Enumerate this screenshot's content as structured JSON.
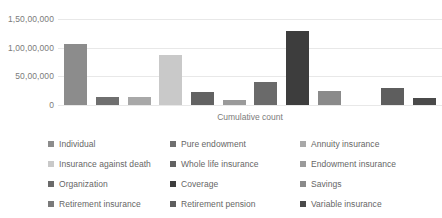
{
  "chart_data": {
    "type": "bar",
    "title": "",
    "xlabel": "Cumulative count",
    "ylabel": "",
    "ylim": [
      0,
      15000000
    ],
    "grid": true,
    "legend_position": "bottom",
    "ytick_labels": [
      "1,50,00,000",
      "1,00,00,000",
      "50,00,000",
      "0"
    ],
    "ytick_values": [
      15000000,
      10000000,
      5000000,
      0
    ],
    "categories": [
      "Individual",
      "Pure endowment",
      "Annuity insurance",
      "Insurance against death",
      "Whole life insurance",
      "Endowment insurance",
      "Organization",
      "Coverage",
      "Savings",
      "Retirement insurance",
      "Retirement pension",
      "Variable insurance"
    ],
    "values": [
      10700000,
      1400000,
      1350000,
      8700000,
      2300000,
      900000,
      4100000,
      12900000,
      2400000,
      0,
      2900000,
      1250000
    ],
    "colors": [
      "#8c8c8c",
      "#6f6f6f",
      "#a8a8a8",
      "#c9c9c9",
      "#626262",
      "#9a9a9a",
      "#6a6a6a",
      "#3d3d3d",
      "#8a8a8a",
      "#7a7a7a",
      "#5e5e5e",
      "#4a4a4a"
    ]
  },
  "legend": {
    "items": [
      {
        "label": "Individual",
        "color": "#8c8c8c"
      },
      {
        "label": "Pure endowment",
        "color": "#6f6f6f"
      },
      {
        "label": "Annuity insurance",
        "color": "#a8a8a8"
      },
      {
        "label": "Insurance against death",
        "color": "#c9c9c9"
      },
      {
        "label": "Whole life insurance",
        "color": "#626262"
      },
      {
        "label": "Endowment insurance",
        "color": "#9a9a9a"
      },
      {
        "label": "Organization",
        "color": "#6a6a6a"
      },
      {
        "label": "Coverage",
        "color": "#3d3d3d"
      },
      {
        "label": "Savings",
        "color": "#8a8a8a"
      },
      {
        "label": "Retirement insurance",
        "color": "#7a7a7a"
      },
      {
        "label": "Retirement pension",
        "color": "#5e5e5e"
      },
      {
        "label": "Variable insurance",
        "color": "#4a4a4a"
      }
    ]
  }
}
